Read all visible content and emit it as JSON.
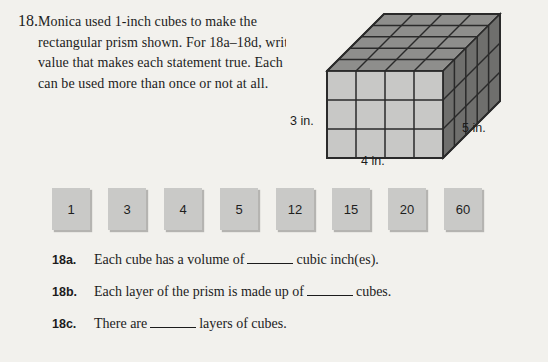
{
  "question": {
    "number": "18.",
    "text": "Monica used 1-inch cubes to make the rectangular prism shown. For 18a–18d, write the value that makes each statement true. Each value can be used more than once or not at all."
  },
  "figure": {
    "name": "rectangular-prism",
    "height_label": "3 in.",
    "width_label": "4 in.",
    "depth_label": "5 in.",
    "units_wide": 4,
    "units_tall": 3,
    "units_deep": 5,
    "colors": {
      "front_face": "#c8c8c6",
      "top_face": "#8e8e8c",
      "side_face": "#6f6f6d",
      "edge": "#2a2a2a"
    }
  },
  "tiles": [
    {
      "label": "1"
    },
    {
      "label": "3"
    },
    {
      "label": "4"
    },
    {
      "label": "5"
    },
    {
      "label": "12"
    },
    {
      "label": "15"
    },
    {
      "label": "20"
    },
    {
      "label": "60"
    }
  ],
  "statements": [
    {
      "label": "18a.",
      "before_blank": "Each cube has a volume of",
      "after_blank": "cubic inch(es)."
    },
    {
      "label": "18b.",
      "before_blank": "Each layer of the prism is made up of",
      "after_blank": "cubes."
    },
    {
      "label": "18c.",
      "before_blank": "There are",
      "after_blank": "layers of cubes."
    }
  ]
}
